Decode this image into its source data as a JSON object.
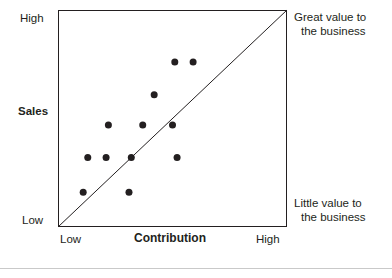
{
  "figure": {
    "background": "#ffffff",
    "ink_color": "#231f20",
    "footer_rule_color": "#c9c9c9"
  },
  "axes": {
    "y_title": "Sales",
    "y_high_label": "High",
    "y_low_label": "Low",
    "x_title": "Contribution",
    "x_low_label": "Low",
    "x_high_label": "High"
  },
  "annotations": {
    "top_right_line1": "Great value to",
    "top_right_line2": "the business",
    "bottom_right_line1": "Little value to",
    "bottom_right_line2": "the business"
  },
  "chart_data": {
    "type": "scatter",
    "title": "",
    "xlabel": "Contribution",
    "ylabel": "Sales",
    "xlim": [
      0,
      100
    ],
    "ylim": [
      0,
      100
    ],
    "xtick_labels": [
      "Low",
      "High"
    ],
    "ytick_labels": [
      "Low",
      "High"
    ],
    "grid": false,
    "legend": "none",
    "marker": {
      "shape": "circle",
      "color": "#231f20",
      "size_px": 7
    },
    "reference_line": {
      "name": "diagonal-parity-line",
      "from": [
        0,
        0
      ],
      "to": [
        100,
        100
      ],
      "color": "#231f20",
      "width_px": 1
    },
    "series": [
      {
        "name": "products",
        "points": [
          {
            "x": 11,
            "y": 16
          },
          {
            "x": 31,
            "y": 16
          },
          {
            "x": 13,
            "y": 32
          },
          {
            "x": 21,
            "y": 32
          },
          {
            "x": 32,
            "y": 32
          },
          {
            "x": 52,
            "y": 32
          },
          {
            "x": 22,
            "y": 47
          },
          {
            "x": 37,
            "y": 47
          },
          {
            "x": 50,
            "y": 47
          },
          {
            "x": 42,
            "y": 61
          },
          {
            "x": 51,
            "y": 76
          },
          {
            "x": 59,
            "y": 76
          }
        ]
      }
    ]
  }
}
